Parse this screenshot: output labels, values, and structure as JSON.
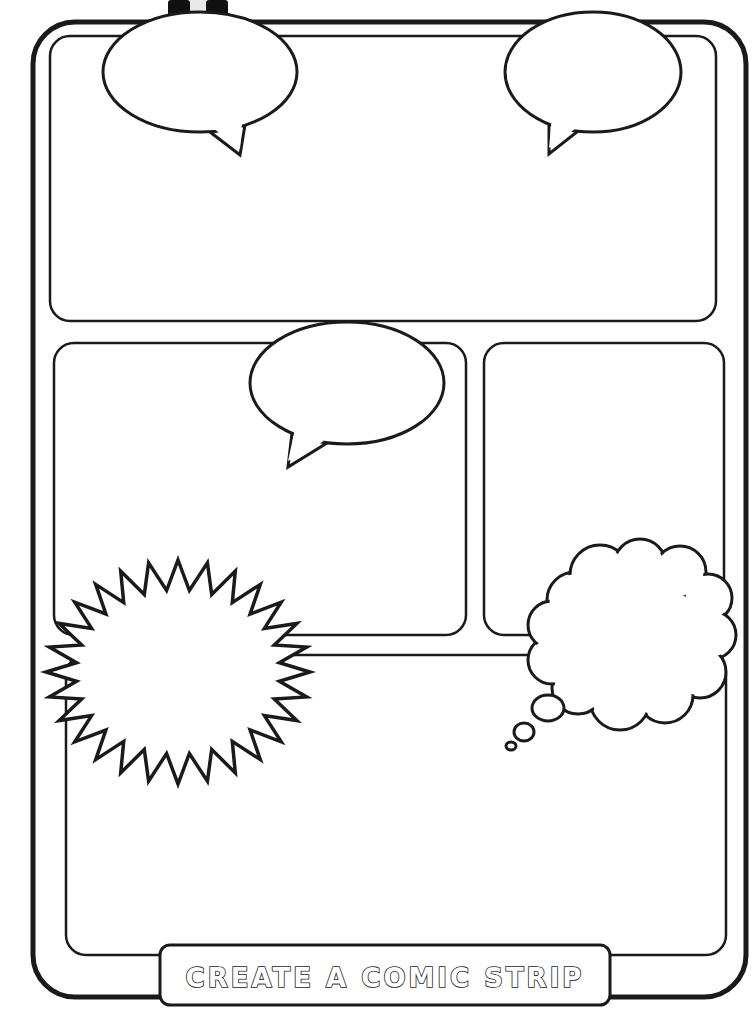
{
  "worksheet": {
    "title": "CREATE A COMIC STRIP",
    "colors": {
      "ink": "#1a1a1a",
      "paper": "#ffffff"
    }
  },
  "frame": {
    "outer": {
      "x": 33,
      "y": 22,
      "w": 713,
      "h": 975,
      "r": 42,
      "stroke": 5
    },
    "inner": {
      "x": 50,
      "y": 36,
      "w": 670,
      "h": 950,
      "r": 26,
      "stroke": 2.5
    }
  },
  "panels": [
    {
      "id": "panel-1",
      "x": 50,
      "y": 36,
      "w": 666,
      "h": 285,
      "r": 20
    },
    {
      "id": "panel-2",
      "x": 54,
      "y": 343,
      "w": 412,
      "h": 292,
      "r": 20
    },
    {
      "id": "panel-3",
      "x": 484,
      "y": 343,
      "w": 240,
      "h": 292,
      "r": 20
    },
    {
      "id": "panel-4",
      "x": 66,
      "y": 655,
      "w": 660,
      "h": 300,
      "r": 20
    }
  ],
  "speech_bubbles": [
    {
      "id": "speech-bubble-top-left",
      "cx": 200,
      "cy": 72,
      "rx": 97,
      "ry": 60,
      "tail": [
        [
          210,
          132
        ],
        [
          240,
          155
        ],
        [
          245,
          125
        ]
      ]
    },
    {
      "id": "speech-bubble-top-right",
      "cx": 593,
      "cy": 72,
      "rx": 88,
      "ry": 60,
      "tail": [
        [
          549,
          120
        ],
        [
          549,
          154
        ],
        [
          582,
          128
        ]
      ]
    },
    {
      "id": "speech-bubble-middle",
      "cx": 347,
      "cy": 383,
      "rx": 97,
      "ry": 61,
      "tail": [
        [
          292,
          433
        ],
        [
          288,
          467
        ],
        [
          327,
          443
        ]
      ]
    }
  ],
  "thought_bubble": {
    "id": "thought-bubble",
    "cx": 628,
    "cy": 634,
    "trail": [
      {
        "cx": 548,
        "cy": 708,
        "rx": 16,
        "ry": 13
      },
      {
        "cx": 524,
        "cy": 732,
        "rx": 10,
        "ry": 9
      },
      {
        "cx": 511,
        "cy": 746,
        "rx": 5,
        "ry": 4
      }
    ]
  },
  "burst": {
    "id": "exclamation-burst",
    "cx": 178,
    "cy": 672,
    "outer_rx": 132,
    "outer_ry": 112,
    "inner_rx": 102,
    "inner_ry": 82,
    "points": 28
  },
  "title_banner": {
    "x": 160,
    "y": 945,
    "w": 450,
    "h": 60,
    "r": 10
  }
}
